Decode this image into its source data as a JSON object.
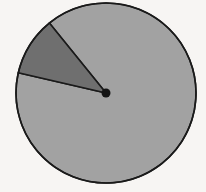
{
  "figure": {
    "name": "pie-chart",
    "background_color": "#f7f5f3",
    "width": 206,
    "height": 192
  },
  "chart_data": {
    "type": "pie",
    "title": "",
    "subtitle": "",
    "xlabel": "",
    "ylabel": "",
    "grid": false,
    "legend": "none",
    "labels_shown": false,
    "categories": [
      "Major slice",
      "Minor slice"
    ],
    "values": [
      89,
      11
    ],
    "units": "percent",
    "colors": [
      "#a2a2a2",
      "#6f6f6f"
    ],
    "edge_color": "#1a1a1a",
    "edge_width": 1.6,
    "start_angle_deg": 193,
    "direction": "clockwise",
    "center": {
      "x": 106,
      "y": 93
    },
    "radius": 90,
    "center_marker": {
      "shown": true,
      "color": "#141414",
      "radius": 4.5
    },
    "slices": [
      {
        "name": "Major slice",
        "value": 89,
        "color": "#a2a2a2",
        "start_angle_deg": 231,
        "end_angle_deg": 193,
        "sweep_deg": 322,
        "exploded": false
      },
      {
        "name": "Minor slice",
        "value": 11,
        "color": "#6f6f6f",
        "start_angle_deg": 193,
        "end_angle_deg": 231,
        "sweep_deg": 38,
        "exploded": false
      }
    ]
  }
}
